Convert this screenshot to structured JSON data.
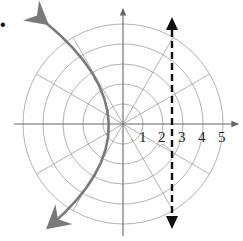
{
  "figure": {
    "type": "polar-graph",
    "bullet": "•",
    "radial_labels": [
      "1",
      "2",
      "3",
      "4",
      "5"
    ],
    "rings": 5,
    "spoke_angle_step_deg": 30,
    "curve": {
      "kind": "parabola",
      "opens": "left",
      "vertex_r": 1.2,
      "color": "#7a7a7a"
    },
    "directrix": {
      "kind": "vertical dashed line",
      "x": 2.5,
      "color": "#111111"
    },
    "colors": {
      "grid": "#9a9a9a",
      "axes": "#666666",
      "curve": "#7a7a7a",
      "directrix": "#111111"
    }
  }
}
